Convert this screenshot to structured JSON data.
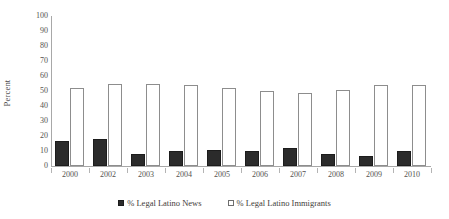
{
  "chart_data": {
    "type": "bar",
    "title": "",
    "xlabel": "",
    "ylabel": "Percent",
    "ylim": [
      0,
      100
    ],
    "ytick_step": 10,
    "yticks": [
      100,
      90,
      80,
      70,
      60,
      50,
      40,
      30,
      20,
      10,
      0
    ],
    "grid": false,
    "legend_position": "bottom-center",
    "categories": [
      "2000",
      "2002",
      "2003",
      "2004",
      "2005",
      "2006",
      "2007",
      "2008",
      "2009",
      "2010"
    ],
    "series": [
      {
        "name": "% Legal Latino News",
        "swatch": "filled",
        "color": "#2b2b2b",
        "values": [
          17,
          18,
          8,
          10,
          11,
          10,
          12,
          8,
          7,
          10
        ]
      },
      {
        "name": "% Legal Latino Immigrants",
        "swatch": "open",
        "color": "#ffffff",
        "border_color": "#8d8d8d",
        "values": [
          52,
          55,
          55,
          54,
          52,
          50,
          49,
          51,
          54,
          54
        ]
      }
    ]
  },
  "axis": {
    "y_title": "Percent",
    "y_ticks": [
      "100",
      "90",
      "80",
      "70",
      "60",
      "50",
      "40",
      "30",
      "20",
      "10",
      "0"
    ],
    "x_ticks": [
      "2000",
      "2002",
      "2003",
      "2004",
      "2005",
      "2006",
      "2007",
      "2008",
      "2009",
      "2010"
    ]
  },
  "legend": {
    "items": [
      {
        "label": "% Legal Latino News"
      },
      {
        "label": "% Legal Latino Immigrants"
      }
    ]
  }
}
